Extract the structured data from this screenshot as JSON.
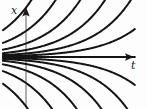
{
  "figure": {
    "kind": "slope-field-solution-curves",
    "background_color": "#fdfdfd",
    "width": 147,
    "height": 109
  },
  "axes": {
    "color": "#8c8c8c",
    "arrow_color": "#1a1a1a",
    "vertical": {
      "label": "x",
      "name": "x-axis",
      "x": 26,
      "y_top": 8,
      "y_bottom": 106,
      "arrow": "up"
    },
    "horizontal": {
      "label": "t",
      "name": "t-axis",
      "y": 57,
      "x_left": 2,
      "x_right": 134,
      "arrow": "right"
    },
    "origin": {
      "x": 26,
      "y": 57
    }
  },
  "chart_data": {
    "type": "line",
    "title": "",
    "xlabel": "t",
    "ylabel": "x",
    "grid": false,
    "legend": null,
    "equation": "x = C e^{kt}",
    "xlim": [
      -0.35,
      1.65
    ],
    "ylim": [
      -1.0,
      1.0
    ],
    "curve_color": "#141414",
    "curve_width": 2.0,
    "series": [
      {
        "name": "C = +0.95",
        "C": 0.95,
        "k": 1.75,
        "exits": "top"
      },
      {
        "name": "C = +0.50",
        "C": 0.5,
        "k": 1.75,
        "exits": "top"
      },
      {
        "name": "C = +0.26",
        "C": 0.26,
        "k": 1.75,
        "exits": "top"
      },
      {
        "name": "C = +0.135",
        "C": 0.135,
        "k": 1.75,
        "exits": "top"
      },
      {
        "name": "C = +0.068",
        "C": 0.068,
        "k": 1.75,
        "exits": "top"
      },
      {
        "name": "C = +0.030",
        "C": 0.03,
        "k": 1.75,
        "exits": "right"
      },
      {
        "name": "C = 0 (equilibrium)",
        "C": 0.0,
        "k": 1.75,
        "exits": "right"
      },
      {
        "name": "C = -0.030",
        "C": -0.03,
        "k": 1.75,
        "exits": "right"
      },
      {
        "name": "C = -0.068",
        "C": -0.068,
        "k": 1.75,
        "exits": "bottom"
      },
      {
        "name": "C = -0.135",
        "C": -0.135,
        "k": 1.75,
        "exits": "bottom"
      },
      {
        "name": "C = -0.26",
        "C": -0.26,
        "k": 1.75,
        "exits": "bottom"
      },
      {
        "name": "C = -0.50",
        "C": -0.5,
        "k": 1.75,
        "exits": "bottom"
      },
      {
        "name": "C = -0.95",
        "C": -0.95,
        "k": 1.75,
        "exits": "bottom"
      }
    ],
    "curve_count": 13,
    "curves_exiting_top": 5,
    "curves_exiting_bottom": 5
  }
}
